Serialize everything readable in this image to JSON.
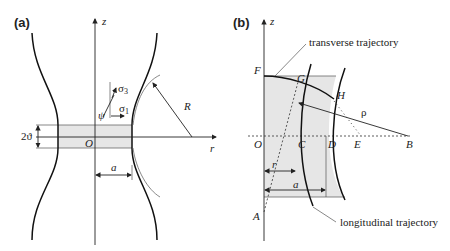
{
  "panel_a": {
    "label": "(a)",
    "axis_z": "z",
    "axis_r": "r",
    "origin": "O",
    "radius_label": "R",
    "neck_half_width": "a",
    "band_height": "2ϑ",
    "stress_1": "σ",
    "stress_1_sub": "1",
    "stress_3": "σ",
    "stress_3_sub": "3",
    "angle": "ψ"
  },
  "panel_b": {
    "label": "(b)",
    "axis_z": "z",
    "points": {
      "F": "F",
      "G": "G",
      "H": "H",
      "O": "O",
      "C": "C",
      "D": "D",
      "E": "E",
      "B": "B",
      "A": "A"
    },
    "rho": "ρ",
    "r": "r",
    "a": "a",
    "transverse_label": "transverse trajectory",
    "longitudinal_label": "longitudinal trajectory"
  }
}
